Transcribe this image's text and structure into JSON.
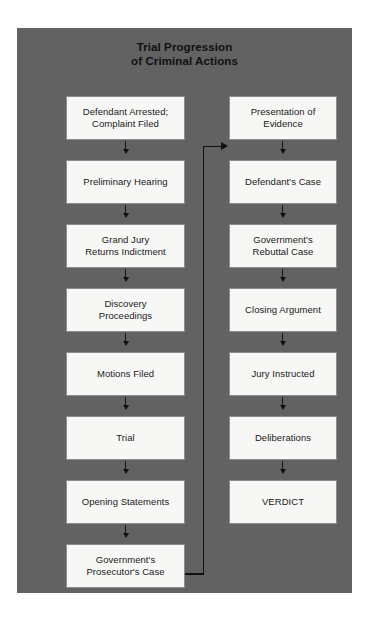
{
  "title": {
    "line1": "Trial Progression",
    "line2": "of Criminal Actions"
  },
  "colors": {
    "panel_background": "#626262",
    "page_background": "#ffffff",
    "node_fill": "#f7f7f5",
    "node_border": "#8e8e8e",
    "text": "#1a1a1a",
    "connector": "#111111"
  },
  "flow": {
    "left_column": [
      {
        "label": "Defendant Arrested;\nComplaint Filed"
      },
      {
        "label": "Preliminary Hearing"
      },
      {
        "label": "Grand Jury\nReturns Indictment"
      },
      {
        "label": "Discovery\nProceedings"
      },
      {
        "label": "Motions Filed"
      },
      {
        "label": "Trial"
      },
      {
        "label": "Opening Statements"
      },
      {
        "label": "Government's\nProsecutor's Case"
      }
    ],
    "right_column": [
      {
        "label": "Presentation of\nEvidence"
      },
      {
        "label": "Defendant's Case"
      },
      {
        "label": "Government's\nRebuttal Case"
      },
      {
        "label": "Closing Argument"
      },
      {
        "label": "Jury Instructed"
      },
      {
        "label": "Deliberations"
      },
      {
        "label": "VERDICT"
      }
    ]
  }
}
